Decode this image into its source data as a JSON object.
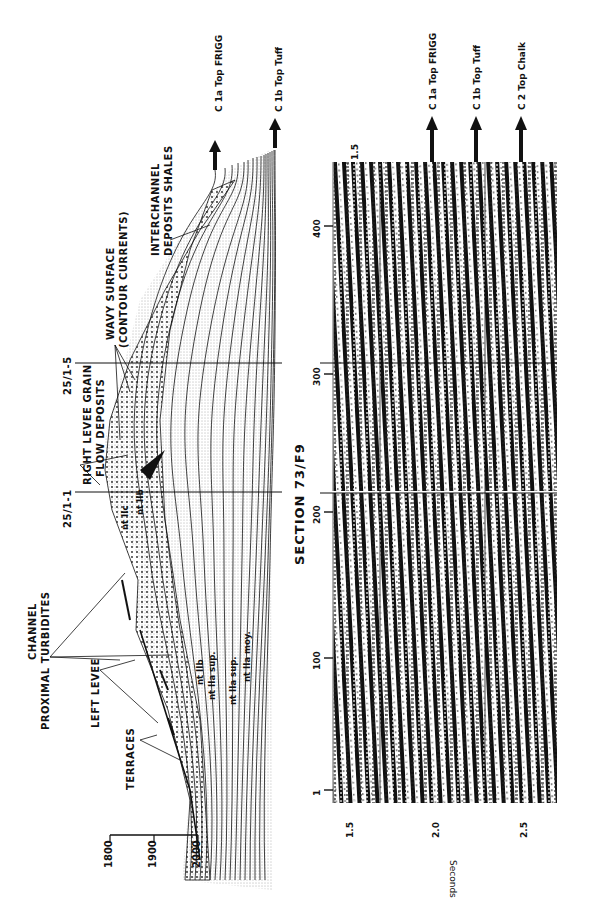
{
  "figure": {
    "title": "SECTION   73/F9",
    "wells": [
      {
        "name": "25/1-1"
      },
      {
        "name": "25/1-5"
      }
    ]
  },
  "interpretation": {
    "depth_axis": {
      "ticks": [
        "1800",
        "1900",
        "2000"
      ]
    },
    "labels": {
      "channel": "CHANNEL",
      "proximal": "PROXIMAL  TURBIDITES",
      "left_levee": "LEFT  LEVEE",
      "terraces": "TERRACES",
      "right_levee_1": "RIGHT LEVEE GRAIN",
      "right_levee_2": "FLOW DEPOSITS",
      "wavy_1": "WAVY   SURFACE",
      "wavy_2": "(CONTOUR  CURRENTS)",
      "interchannel_1": "INTERCHANNEL",
      "interchannel_2": "DEPOSITS  SHALES"
    },
    "units": [
      "nt IIc",
      "nt IIb",
      "nt IIb",
      "nt IIa sup.",
      "nt IIa sup.",
      "nt IIa moy."
    ],
    "horizons": [
      "C 1a Top FRIGG",
      "C 1b Top Tuff"
    ]
  },
  "seismic": {
    "trace_axis": {
      "ticks": [
        "1",
        "100",
        "200",
        "300",
        "400"
      ]
    },
    "time_axis": {
      "label": "Seconds",
      "ticks": [
        "1.5",
        "2.0",
        "2.5"
      ],
      "top_tick": "1.5"
    },
    "horizons": [
      "C 1a  Top FRIGG",
      "C 1b  Top Tuff",
      "C 2  Top  Chalk"
    ]
  }
}
